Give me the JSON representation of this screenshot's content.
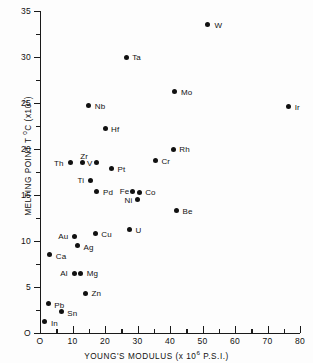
{
  "chart_data": {
    "type": "scatter",
    "title": "",
    "xlabel": "YOUNG'S MODULUS (x 10^6 P.S.I.)",
    "ylabel": "MELTING POINT T °C (x10^2)",
    "xlim": [
      0,
      80
    ],
    "ylim": [
      0,
      35
    ],
    "grid": false,
    "legend": "none",
    "x_ticks": [
      "O",
      "10",
      "20",
      "30",
      "40",
      "50",
      "60",
      "70",
      "80"
    ],
    "x_tick_values": [
      0,
      10,
      20,
      30,
      40,
      50,
      60,
      70,
      80
    ],
    "x_minor_values": [
      5,
      15,
      25,
      35,
      45,
      55,
      65,
      75
    ],
    "y_ticks": [
      "O",
      "5",
      "10",
      "15",
      "20",
      "25",
      "30",
      "35"
    ],
    "y_tick_values": [
      0,
      5,
      10,
      15,
      20,
      25,
      30,
      35
    ],
    "y_minor_values": [
      2.5,
      7.5,
      12.5,
      17.5,
      22.5,
      27.5,
      32.5
    ],
    "points": [
      {
        "label": "W",
        "x": 51.5,
        "y": 33.5,
        "lx": 7,
        "ly": -4
      },
      {
        "label": "Ta",
        "x": 26.5,
        "y": 30.0,
        "lx": 6,
        "ly": -4
      },
      {
        "label": "Ir",
        "x": 76.5,
        "y": 24.6,
        "lx": 6,
        "ly": -4
      },
      {
        "label": "Mo",
        "x": 41.5,
        "y": 26.2,
        "lx": 6,
        "ly": -4
      },
      {
        "label": "Nb",
        "x": 15.0,
        "y": 24.7,
        "lx": 6,
        "ly": -4
      },
      {
        "label": "Hf",
        "x": 20.0,
        "y": 22.2,
        "lx": 6,
        "ly": -4
      },
      {
        "label": "Rh",
        "x": 41.0,
        "y": 19.9,
        "lx": 6,
        "ly": -5
      },
      {
        "label": "Cr",
        "x": 35.5,
        "y": 18.7,
        "lx": 6,
        "ly": -4
      },
      {
        "label": "Th",
        "x": 9.5,
        "y": 18.5,
        "lx": -17,
        "ly": -4
      },
      {
        "label": "Zr",
        "x": 13.0,
        "y": 18.5,
        "lx": -2,
        "ly": -11
      },
      {
        "label": "V",
        "x": 17.5,
        "y": 18.5,
        "lx": -10,
        "ly": -4
      },
      {
        "label": "Pt",
        "x": 22.0,
        "y": 17.9,
        "lx": 6,
        "ly": -3
      },
      {
        "label": "Ti",
        "x": 15.5,
        "y": 16.6,
        "lx": -13,
        "ly": -4
      },
      {
        "label": "Pd",
        "x": 17.5,
        "y": 15.4,
        "lx": 6,
        "ly": -3
      },
      {
        "label": "Fe",
        "x": 28.5,
        "y": 15.4,
        "lx": -13,
        "ly": -4
      },
      {
        "label": "Co",
        "x": 30.5,
        "y": 15.3,
        "lx": 6,
        "ly": -4
      },
      {
        "label": "Ni",
        "x": 30.0,
        "y": 14.5,
        "lx": -13,
        "ly": -4
      },
      {
        "label": "Be",
        "x": 42.0,
        "y": 13.3,
        "lx": 6,
        "ly": -4
      },
      {
        "label": "U",
        "x": 27.5,
        "y": 11.2,
        "lx": 6,
        "ly": -4
      },
      {
        "label": "Cu",
        "x": 17.0,
        "y": 10.8,
        "lx": 6,
        "ly": -4
      },
      {
        "label": "Au",
        "x": 10.5,
        "y": 10.5,
        "lx": -16,
        "ly": -4
      },
      {
        "label": "Ag",
        "x": 11.5,
        "y": 9.5,
        "lx": 6,
        "ly": -3
      },
      {
        "label": "Ca",
        "x": 3.0,
        "y": 8.5,
        "lx": 6,
        "ly": -3
      },
      {
        "label": "Al",
        "x": 10.5,
        "y": 6.5,
        "lx": -14,
        "ly": -4
      },
      {
        "label": "Mg",
        "x": 12.5,
        "y": 6.5,
        "lx": 6,
        "ly": -4
      },
      {
        "label": "Zn",
        "x": 14.0,
        "y": 4.3,
        "lx": 6,
        "ly": -4
      },
      {
        "label": "Pb",
        "x": 2.5,
        "y": 3.2,
        "lx": 6,
        "ly": -3
      },
      {
        "label": "Sn",
        "x": 6.5,
        "y": 2.3,
        "lx": 6,
        "ly": -3
      },
      {
        "label": "In",
        "x": 1.5,
        "y": 1.2,
        "lx": 6,
        "ly": -3
      }
    ]
  }
}
